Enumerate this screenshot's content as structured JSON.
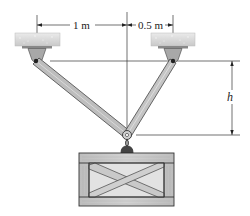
{
  "diagram": {
    "title": "",
    "labels": {
      "left_span": "1 m",
      "right_span": "0.5 m",
      "height": "h"
    },
    "components": {
      "left_support": "fixed ceiling support (left)",
      "right_support": "fixed ceiling support (right)",
      "left_member": "inclined rod from left support to common pin",
      "right_member": "inclined rod from right support to common pin",
      "common_pin": "pin joint connecting both rods",
      "hook": "hook link",
      "crate": "wooden crate with cross bracing"
    },
    "colors": {
      "support": "#d9d9d9",
      "member": "#b9b9b9",
      "member_edge": "#555555",
      "crate_wood": "#c7c7c7",
      "crate_inner": "#e3e3e3",
      "line": "#333333"
    }
  }
}
